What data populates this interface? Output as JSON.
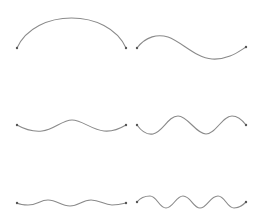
{
  "diagram": {
    "title": "",
    "stroke_color": "#8a8a8a",
    "endpoint_color": "#555555",
    "background": "#ffffff",
    "curves": [
      {
        "id": "wave-1",
        "row": 1,
        "col": 1,
        "start": [
          17,
          48
        ],
        "end": [
          126,
          48
        ],
        "half_periods": 1,
        "amplitude": 33,
        "phase": "up",
        "path": "M17,48 C35,8 108,8 126,48"
      },
      {
        "id": "wave-2",
        "row": 1,
        "col": 2,
        "start": [
          137,
          48
        ],
        "end": [
          246,
          47
        ],
        "half_periods": 2,
        "amplitude": 12,
        "phase": "up",
        "path": "M137,48 C146,36 158,34 168,37 C182,42 196,58 212,59 C228,60 238,52 246,47"
      },
      {
        "id": "wave-3",
        "row": 2,
        "col": 1,
        "start": [
          17,
          125
        ],
        "end": [
          126,
          125
        ],
        "half_periods": 3,
        "amplitude": 5,
        "phase": "down",
        "path": "M17,125 C24,129 32,132 42,131 C54,130 62,120 72,120 C82,120 92,130 104,131 C114,132 121,128 126,125"
      },
      {
        "id": "wave-4",
        "row": 2,
        "col": 2,
        "start": [
          137,
          125
        ],
        "end": [
          246,
          125
        ],
        "half_periods": 4,
        "amplitude": 9,
        "phase": "down",
        "path": "M137,125 C142,132 147,135 153,134 C163,132 168,116 178,116 C188,116 196,134 206,134 C216,134 222,116 232,116 C239,116 243,121 246,125"
      },
      {
        "id": "wave-5",
        "row": 3,
        "col": 1,
        "start": [
          17,
          203
        ],
        "end": [
          126,
          203
        ],
        "half_periods": 4,
        "amplitude": 3,
        "phase": "down",
        "path": "M17,203 C21,205 24,205 28,205 C37,205 40,200 48,200 C57,200 61,206 70,206 C79,206 82,200 91,200 C100,200 104,205 112,205 C118,205 122,204 126,203"
      },
      {
        "id": "wave-6",
        "row": 3,
        "col": 2,
        "start": [
          137,
          202
        ],
        "end": [
          246,
          202
        ],
        "half_periods": 7,
        "amplitude": 6,
        "phase": "up",
        "path": "M137,202 C141,197 145,196 150,196 C157,196 159,208 166,208 C173,208 176,196 183,196 C191,196 193,208 200,208 C207,208 210,196 218,196 C225,196 227,208 234,208 C240,208 243,205 246,202"
      }
    ]
  }
}
